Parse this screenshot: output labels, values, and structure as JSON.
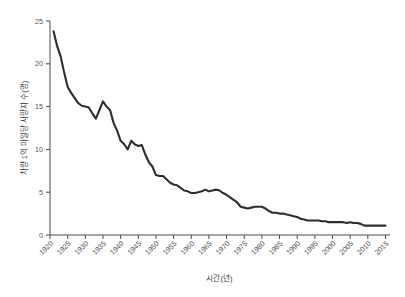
{
  "chart_data": {
    "type": "line",
    "title": "",
    "subtitle": "",
    "xlabel": "시간(년)",
    "ylabel": "차량 1억 마일당 사망자 수(명)",
    "xlim": [
      1920,
      2016
    ],
    "ylim": [
      0,
      25
    ],
    "grid": false,
    "legend": null,
    "legend_position": "none",
    "x_tick_labels": [
      "1920",
      "1925",
      "1930",
      "1935",
      "1940",
      "1945",
      "1950",
      "1955",
      "1960",
      "1965",
      "1970",
      "1975",
      "1980",
      "1985",
      "1990",
      "1995",
      "2000",
      "2005",
      "2010",
      "2015"
    ],
    "x_tick_values": [
      1920,
      1925,
      1930,
      1935,
      1940,
      1945,
      1950,
      1955,
      1960,
      1965,
      1970,
      1975,
      1980,
      1985,
      1990,
      1995,
      2000,
      2005,
      2010,
      2015
    ],
    "y_tick_labels": [
      "0",
      "5",
      "10",
      "15",
      "20",
      "25"
    ],
    "y_tick_values": [
      0,
      5,
      10,
      15,
      20,
      25
    ],
    "line_color": "#2e2e2e",
    "axis_color": "#4a4a4a",
    "background_color": "#ffffff",
    "series": [
      {
        "name": "차량 1억 마일당 사망자 수",
        "x": [
          1921,
          1922,
          1923,
          1924,
          1925,
          1926,
          1927,
          1928,
          1929,
          1930,
          1931,
          1932,
          1933,
          1934,
          1935,
          1936,
          1937,
          1938,
          1939,
          1940,
          1941,
          1942,
          1943,
          1944,
          1945,
          1946,
          1947,
          1948,
          1949,
          1950,
          1951,
          1952,
          1953,
          1954,
          1955,
          1956,
          1957,
          1958,
          1959,
          1960,
          1961,
          1962,
          1963,
          1964,
          1965,
          1966,
          1967,
          1968,
          1969,
          1970,
          1971,
          1972,
          1973,
          1974,
          1975,
          1976,
          1977,
          1978,
          1979,
          1980,
          1981,
          1982,
          1983,
          1984,
          1985,
          1986,
          1987,
          1988,
          1989,
          1990,
          1991,
          1992,
          1993,
          1994,
          1995,
          1996,
          1997,
          1998,
          1999,
          2000,
          2001,
          2002,
          2003,
          2004,
          2005,
          2006,
          2007,
          2008,
          2009,
          2010,
          2011,
          2012,
          2013,
          2014,
          2015
        ],
        "values": [
          23.8,
          22.1,
          20.9,
          19.0,
          17.3,
          16.6,
          16.0,
          15.4,
          15.1,
          15.0,
          14.9,
          14.2,
          13.6,
          14.6,
          15.6,
          15.0,
          14.6,
          13.1,
          12.2,
          11.0,
          10.6,
          10.0,
          11.0,
          10.6,
          10.4,
          10.5,
          9.4,
          8.5,
          8.0,
          7.0,
          6.9,
          6.9,
          6.5,
          6.1,
          5.9,
          5.8,
          5.5,
          5.2,
          5.1,
          4.9,
          4.9,
          5.0,
          5.1,
          5.3,
          5.1,
          5.2,
          5.3,
          5.2,
          4.9,
          4.7,
          4.4,
          4.1,
          3.8,
          3.3,
          3.2,
          3.1,
          3.2,
          3.3,
          3.3,
          3.3,
          3.1,
          2.8,
          2.6,
          2.6,
          2.5,
          2.5,
          2.4,
          2.3,
          2.2,
          2.1,
          1.9,
          1.8,
          1.7,
          1.7,
          1.7,
          1.7,
          1.6,
          1.6,
          1.5,
          1.5,
          1.5,
          1.5,
          1.5,
          1.4,
          1.5,
          1.4,
          1.4,
          1.3,
          1.1,
          1.1,
          1.1,
          1.1,
          1.1,
          1.1,
          1.1
        ]
      }
    ]
  }
}
